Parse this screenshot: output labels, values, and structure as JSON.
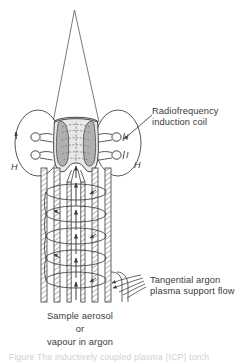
{
  "figure": {
    "type": "diagram",
    "background_color": "#ffffff",
    "line_color": "#3a3a3a",
    "plasma_fill_color": "#b4b4b4",
    "plasma_core_color": "#d9d9d9",
    "dashed_field_color": "#8a8a8a"
  },
  "labels": {
    "coil": {
      "line1": "Radiofrequency",
      "line2": "induction coil"
    },
    "tangential": {
      "line1": "Tangential argon",
      "line2": "plasma support flow"
    },
    "sample": {
      "line1": "Sample aerosol",
      "line2": "or",
      "line3": "vapour in argon"
    },
    "field_left": "H",
    "field_right": "H",
    "current_upper": "I",
    "current_lower": "I"
  },
  "caption": {
    "text": "Figure   The inductively coupled plasma (ICP) torch"
  },
  "components": {
    "plume": "plasma-plume",
    "plasma_toroid": "plasma-toroid",
    "coil_turns": 2,
    "torch_tubes": 3,
    "swirl_loops": 5,
    "axial_arrows": 5
  }
}
